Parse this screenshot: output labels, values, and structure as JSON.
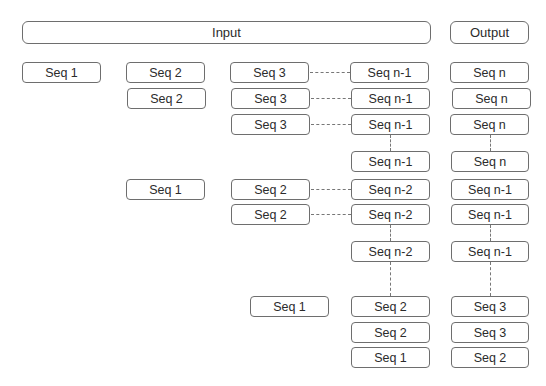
{
  "headers": {
    "input": "Input",
    "output": "Output"
  },
  "boxes": [
    {
      "id": "b1",
      "label": "Seq 1",
      "x": 22,
      "y": 62,
      "w": 79
    },
    {
      "id": "b2",
      "label": "Seq 2",
      "x": 126,
      "y": 62,
      "w": 79
    },
    {
      "id": "b3",
      "label": "Seq 2",
      "x": 127,
      "y": 88,
      "w": 79
    },
    {
      "id": "b4",
      "label": "Seq 3",
      "x": 230,
      "y": 62,
      "w": 79
    },
    {
      "id": "b5",
      "label": "Seq 3",
      "x": 231,
      "y": 88,
      "w": 79
    },
    {
      "id": "b6",
      "label": "Seq 3",
      "x": 231,
      "y": 114,
      "w": 79
    },
    {
      "id": "b7",
      "label": "Seq n-1",
      "x": 350,
      "y": 62,
      "w": 79
    },
    {
      "id": "b8",
      "label": "Seq n-1",
      "x": 351,
      "y": 88,
      "w": 79
    },
    {
      "id": "b9",
      "label": "Seq n-1",
      "x": 351,
      "y": 114,
      "w": 79
    },
    {
      "id": "b10",
      "label": "Seq n",
      "x": 450,
      "y": 62,
      "w": 79
    },
    {
      "id": "b11",
      "label": "Seq n",
      "x": 452,
      "y": 88,
      "w": 79
    },
    {
      "id": "b12",
      "label": "Seq n",
      "x": 450,
      "y": 114,
      "w": 79
    },
    {
      "id": "b13",
      "label": "Seq n-1",
      "x": 351,
      "y": 151,
      "w": 79
    },
    {
      "id": "b14",
      "label": "Seq n",
      "x": 451,
      "y": 151,
      "w": 78
    },
    {
      "id": "b15",
      "label": "Seq 1",
      "x": 126,
      "y": 179,
      "w": 79
    },
    {
      "id": "b16",
      "label": "Seq 2",
      "x": 231,
      "y": 179,
      "w": 79
    },
    {
      "id": "b17",
      "label": "Seq n-2",
      "x": 351,
      "y": 179,
      "w": 79
    },
    {
      "id": "b18",
      "label": "Seq n-1",
      "x": 451,
      "y": 179,
      "w": 78
    },
    {
      "id": "b19",
      "label": "Seq 2",
      "x": 231,
      "y": 204,
      "w": 79
    },
    {
      "id": "b20",
      "label": "Seq n-2",
      "x": 351,
      "y": 204,
      "w": 79
    },
    {
      "id": "b21",
      "label": "Seq n-1",
      "x": 451,
      "y": 204,
      "w": 78
    },
    {
      "id": "b22",
      "label": "Seq n-2",
      "x": 351,
      "y": 241,
      "w": 79
    },
    {
      "id": "b23",
      "label": "Seq n-1",
      "x": 451,
      "y": 241,
      "w": 78
    },
    {
      "id": "b24",
      "label": "Seq 1",
      "x": 250,
      "y": 296,
      "w": 79
    },
    {
      "id": "b25",
      "label": "Seq 2",
      "x": 351,
      "y": 296,
      "w": 79
    },
    {
      "id": "b26",
      "label": "Seq 3",
      "x": 451,
      "y": 296,
      "w": 78
    },
    {
      "id": "b27",
      "label": "Seq 2",
      "x": 351,
      "y": 322,
      "w": 79
    },
    {
      "id": "b28",
      "label": "Seq 3",
      "x": 451,
      "y": 322,
      "w": 78
    },
    {
      "id": "b29",
      "label": "Seq 1",
      "x": 351,
      "y": 347,
      "w": 79
    },
    {
      "id": "b30",
      "label": "Seq 2",
      "x": 451,
      "y": 347,
      "w": 78
    }
  ]
}
